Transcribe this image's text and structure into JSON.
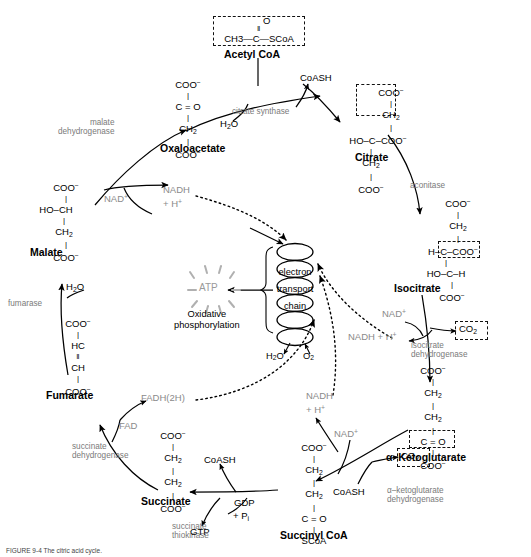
{
  "figure": {
    "caption": "FIGURE 9-4  The citric acid cycle."
  },
  "metabolites": {
    "acetyl_coa": {
      "name": "Acetyl CoA",
      "formula_top": "O",
      "formula_main": "CH3—C—SCoA",
      "boxed": true
    },
    "oxaloacetate": {
      "name": "Oxaloacetate",
      "lines": [
        "COO⁻",
        "C = O",
        "CH2",
        "COO⁻"
      ]
    },
    "citrate": {
      "name": "Citrate",
      "lines": [
        "COO⁻",
        "CH2",
        "HO—C—COO⁻",
        "CH2",
        "COO⁻"
      ],
      "boxed_part": "COO⁻ / CH2"
    },
    "isocitrate": {
      "name": "Isocitrate",
      "lines": [
        "COO⁻",
        "CH2",
        "H—C—COO⁻",
        "HO—C—H",
        "COO⁻"
      ],
      "boxed_part": "COO⁻"
    },
    "alpha_ketoglutarate": {
      "name": "α–Ketoglutarate",
      "lines": [
        "COO⁻",
        "CH2",
        "CH2",
        "C = O",
        "COO⁻"
      ],
      "boxed_part": "COO⁻"
    },
    "succinyl_coa": {
      "name": "Succinyl CoA",
      "lines": [
        "COO⁻",
        "CH2",
        "CH2",
        "C = O",
        "SCoA"
      ]
    },
    "succinate": {
      "name": "Succinate",
      "lines": [
        "COO⁻",
        "CH2",
        "CH2",
        "COO⁻"
      ]
    },
    "fumarate": {
      "name": "Fumarate",
      "lines": [
        "COO⁻",
        "HC",
        "CH",
        "COO⁻"
      ]
    },
    "malate": {
      "name": "Malate",
      "lines": [
        "COO⁻",
        "HO—CH",
        "CH2",
        "COO⁻"
      ]
    }
  },
  "enzymes": {
    "citrate_synthase": "citrate synthase",
    "aconitase": "aconitase",
    "isocitrate_dehydrogenase_l1": "isocitrate",
    "isocitrate_dehydrogenase_l2": "dehydrogenase",
    "alpha_kg_dehydrogenase_l1": "α–ketoglutarate",
    "alpha_kg_dehydrogenase_l2": "dehydrogenase",
    "succinate_thiokinase_l1": "succinate",
    "succinate_thiokinase_l2": "thiokinase",
    "succinate_dehydrogenase_l1": "succinate",
    "succinate_dehydrogenase_l2": "dehydrogenase",
    "fumarase": "fumarase",
    "malate_dehydrogenase_l1": "malate",
    "malate_dehydrogenase_l2": "dehydrogenase"
  },
  "cofactors": {
    "coash_top": "CoASH",
    "coash_mid": "CoASH",
    "coash_bottom": "CoASH",
    "h2o_citrate": "H2O",
    "h2o_fumarase": "H2O",
    "nad_plus_malate": "NAD⁺",
    "nadh_h_malate_l1": "NADH",
    "nadh_h_malate_l2": "+ H⁺",
    "nad_plus_isocitrate": "NAD⁺",
    "nadh_h_isocitrate": "NADH + H⁺",
    "co2_isocitrate": "CO2",
    "nad_plus_akg": "NAD⁺",
    "nadh_h_akg_l1": "NADH",
    "nadh_h_akg_l2": "+ H⁺",
    "co2_akg": "CO2",
    "fad": "FAD",
    "fadh2h": "FADH(2H)",
    "gdp": "GDP",
    "pi": "+ Pi",
    "gtp": "GTP"
  },
  "oxidative_phosphorylation": {
    "atp": "ATP",
    "label_l1": "Oxidative",
    "label_l2": "phosphorylation",
    "chain_l1": "electron",
    "chain_l2": "transport",
    "chain_l3": "chain",
    "h2o": "H2O",
    "o2": "O2"
  }
}
